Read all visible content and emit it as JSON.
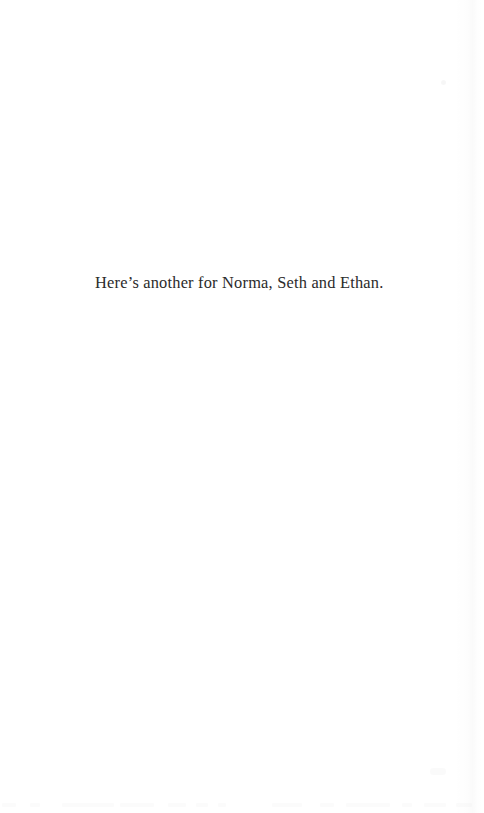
{
  "document": {
    "type": "scanned-book-page",
    "page_kind": "dedication-page",
    "background_color": "#ffffff",
    "text_color": "#2b2b2b",
    "body": {
      "dedication": "Here’s another for Norma, Seth and Ethan."
    },
    "artifacts": {
      "edge_shading": "right-page-edge-shadow",
      "speck": "scan-speck",
      "bleed_through": "faint-next-page-text-bleed"
    }
  }
}
